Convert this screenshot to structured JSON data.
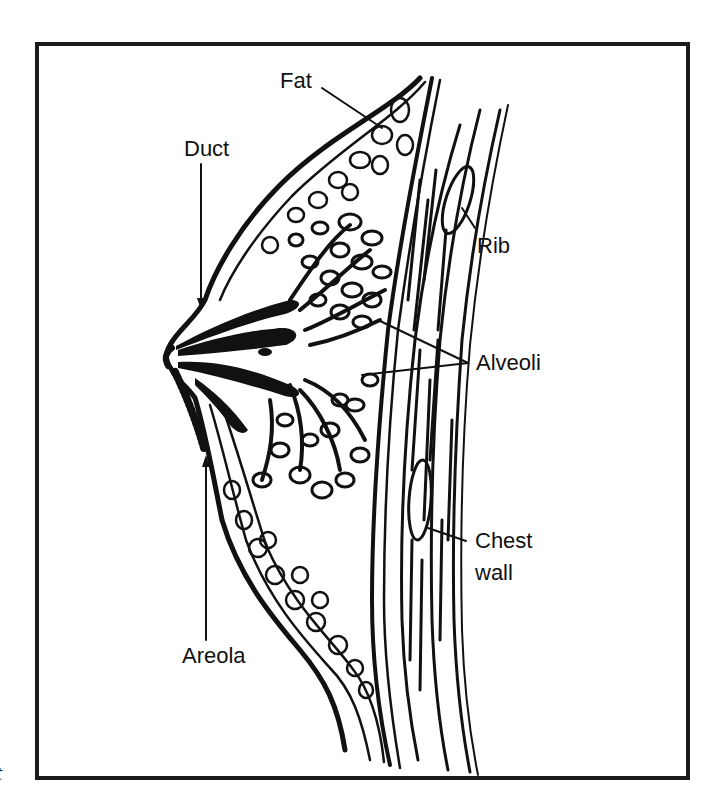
{
  "diagram": {
    "type": "anatomical-cross-section",
    "style": "black ink line drawing",
    "colors": {
      "ink": "#111111",
      "background": "#ffffff",
      "frame": "#1a1a1a"
    },
    "labels": [
      {
        "id": "fat",
        "text": "Fat"
      },
      {
        "id": "duct",
        "text": "Duct"
      },
      {
        "id": "rib",
        "text": "Rib"
      },
      {
        "id": "alveoli",
        "text": "Alveoli"
      },
      {
        "id": "chest_wall_line1",
        "text": "Chest"
      },
      {
        "id": "chest_wall_line2",
        "text": "wall"
      },
      {
        "id": "areola",
        "text": "Areola"
      }
    ],
    "stray_glyph": "t"
  }
}
